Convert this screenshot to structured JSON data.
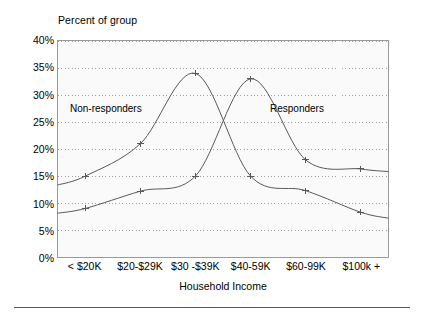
{
  "chart_data": {
    "type": "line",
    "title": "Percent of group",
    "xlabel": "Household Income",
    "ylabel": "Percent of group",
    "categories": [
      "< $20K",
      "$20-$29K",
      "$30 -$39K",
      "$40-59K",
      "$60-99K",
      "$100k +"
    ],
    "series": [
      {
        "name": "Non-responders",
        "values": [
          15.0,
          21.0,
          34.0,
          15.0,
          12.3,
          8.3
        ],
        "marker": "plus"
      },
      {
        "name": "Responders",
        "values": [
          9.0,
          12.2,
          15.0,
          33.0,
          18.0,
          16.3
        ],
        "marker": "plus"
      }
    ],
    "ylim": [
      0,
      40
    ],
    "ytick_step": 5,
    "ytick_labels": [
      "0%",
      "5%",
      "10%",
      "15%",
      "20%",
      "25%",
      "30%",
      "35%",
      "40%"
    ],
    "ytick_values": [
      0,
      5,
      10,
      15,
      20,
      25,
      30,
      35,
      40
    ],
    "grid": "horizontal-dotted",
    "legend": "inline-annotations",
    "annotations": [
      {
        "text": "Non-responders",
        "position": "upper-left"
      },
      {
        "text": "Responders",
        "position": "upper-right"
      }
    ],
    "line_color": "#58585a",
    "plot_background": "#fafafa",
    "grid_color": "#9f9f9f"
  },
  "colors": {
    "line": "#58585a",
    "grid": "#9f9f9f",
    "frame": "#9a9a9a",
    "plot_bg": "#fafafa",
    "text": "#000000",
    "rule": "#58585a"
  }
}
